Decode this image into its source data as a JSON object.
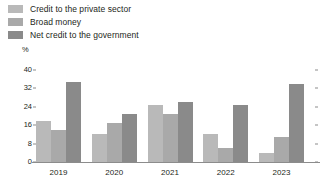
{
  "chart_data": {
    "type": "bar",
    "title": "",
    "xlabel": "",
    "ylabel": "%",
    "unit_label": "%",
    "ylim": [
      0,
      40
    ],
    "yticks": [
      0,
      8,
      16,
      24,
      32,
      40
    ],
    "ytick_labels": [
      "0",
      "8",
      "16",
      "24",
      "32",
      "40"
    ],
    "grid": false,
    "legend_position": "top-left",
    "categories": [
      "2019",
      "2020",
      "2021",
      "2022",
      "2023"
    ],
    "series": [
      {
        "name": "Credit to the private sector",
        "color": "#b9b9b9",
        "values": [
          18,
          12,
          25,
          12,
          4
        ]
      },
      {
        "name": "Broad money",
        "color": "#a9a9a9",
        "values": [
          14,
          17,
          21,
          6,
          11
        ]
      },
      {
        "name": "Net credit to the government",
        "color": "#8a8a8a",
        "values": [
          35,
          21,
          26,
          25,
          34
        ]
      }
    ]
  },
  "axis": {
    "unit": "%"
  },
  "colors": {
    "axis_line": "#8c8c8c",
    "text": "#231f20",
    "background": "#ffffff"
  }
}
